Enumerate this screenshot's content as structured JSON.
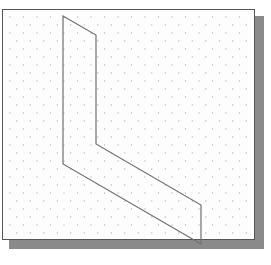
{
  "diagram": {
    "type": "isometric-sketch",
    "grid": {
      "style": "isometric-dots",
      "dx": 13.5,
      "dy": 8,
      "dot_color": "#b8b8b8"
    },
    "frame": {
      "x": 2,
      "y": 9,
      "w": 253,
      "h": 231,
      "border_color": "#555555",
      "shadow_color": "#8a8a8a"
    },
    "shape": {
      "name": "L-shaped isometric outline",
      "stroke": "#707070",
      "points": [
        [
          63,
          16
        ],
        [
          96,
          35
        ],
        [
          96,
          144
        ],
        [
          201,
          205
        ],
        [
          201,
          244
        ],
        [
          63,
          164
        ]
      ]
    }
  }
}
